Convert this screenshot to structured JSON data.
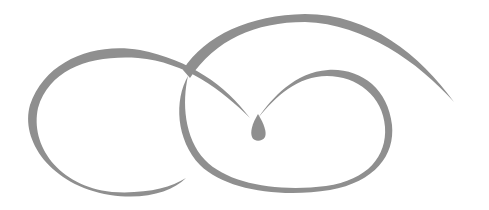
{
  "image": {
    "type": "decorative-flourish",
    "description": "Gray calligraphic swirl ornament with two interlocking loops and a teardrop center",
    "colors": {
      "stroke": "#8c8c8c",
      "background": "#ffffff"
    }
  }
}
